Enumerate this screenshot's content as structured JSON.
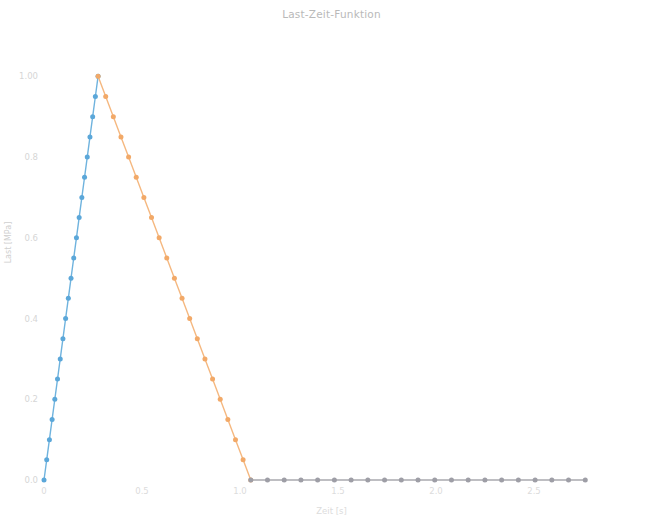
{
  "chart_data": {
    "type": "line",
    "title": "Last-Zeit-Funktion",
    "xlabel": "Zeit [s]",
    "ylabel": "Last [MPa]",
    "xlim": [
      0,
      2.75
    ],
    "ylim": [
      0,
      1.09
    ],
    "grid": false,
    "legend": null,
    "xticks": [
      0,
      0.5,
      1.0,
      1.5,
      2.0,
      2.5
    ],
    "xtick_labels": [
      "0",
      "0.5",
      "1.0",
      "1.5",
      "2.0",
      "2.5"
    ],
    "yticks": [
      0.0,
      0.2,
      0.4,
      0.6,
      0.8,
      1.0
    ],
    "ytick_labels": [
      "0.0",
      "0.2",
      "0.4",
      "0.6",
      "0.8",
      "1.00"
    ],
    "marker": "circle",
    "series": [
      {
        "name": "Anstieg",
        "color": "#6fb3de",
        "marker_color": "#5ba7d9",
        "x": [
          0.0,
          0.0138,
          0.0276,
          0.0414,
          0.0552,
          0.069,
          0.0828,
          0.0966,
          0.1103,
          0.1241,
          0.1379,
          0.1517,
          0.1655,
          0.1793,
          0.1931,
          0.2069,
          0.2207,
          0.2345,
          0.2483,
          0.2621,
          0.2759
        ],
        "y": [
          0.0,
          0.05,
          0.1,
          0.15,
          0.2,
          0.25,
          0.3,
          0.35,
          0.4,
          0.45,
          0.5,
          0.55,
          0.6,
          0.65,
          0.7,
          0.75,
          0.8,
          0.85,
          0.9,
          0.95,
          1.0
        ]
      },
      {
        "name": "Abfall",
        "color": "#f5b880",
        "marker_color": "#f2a968",
        "x": [
          0.2759,
          0.3148,
          0.3538,
          0.3927,
          0.4317,
          0.4706,
          0.5096,
          0.5485,
          0.5875,
          0.6264,
          0.6654,
          0.7043,
          0.7433,
          0.7822,
          0.8212,
          0.8601,
          0.8991,
          0.938,
          0.977,
          1.0159,
          1.0549
        ],
        "y": [
          1.0,
          0.95,
          0.9,
          0.85,
          0.8,
          0.75,
          0.7,
          0.65,
          0.6,
          0.55,
          0.5,
          0.45,
          0.4,
          0.35,
          0.3,
          0.25,
          0.2,
          0.15,
          0.1,
          0.05,
          0.0
        ]
      },
      {
        "name": "Nulllast",
        "color": "#a9a9ae",
        "marker_color": "#9e9ea6",
        "x": [
          1.0549,
          1.1402,
          1.2256,
          1.3109,
          1.3962,
          1.4816,
          1.5669,
          1.6522,
          1.7376,
          1.8229,
          1.9082,
          1.9936,
          2.0789,
          2.1642,
          2.2496,
          2.3349,
          2.4202,
          2.5056,
          2.5909,
          2.6762,
          2.7616
        ],
        "y": [
          0.0,
          0.0,
          0.0,
          0.0,
          0.0,
          0.0,
          0.0,
          0.0,
          0.0,
          0.0,
          0.0,
          0.0,
          0.0,
          0.0,
          0.0,
          0.0,
          0.0,
          0.0,
          0.0,
          0.0,
          0.0
        ]
      }
    ]
  }
}
